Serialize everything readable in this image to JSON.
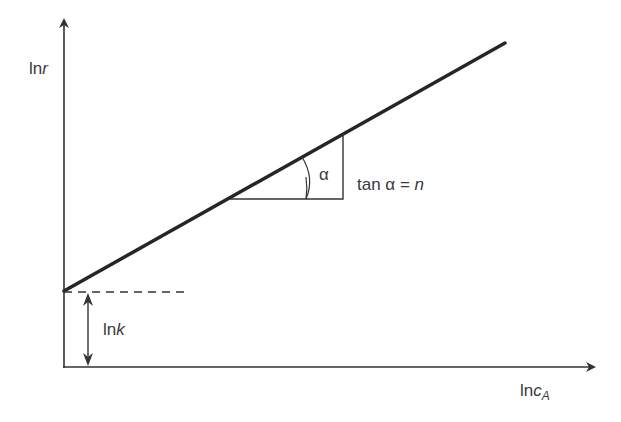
{
  "diagram": {
    "y_axis_label": {
      "prefix": "ln",
      "var": "r"
    },
    "x_axis_label": {
      "prefix": "ln",
      "var": "c",
      "subscript": "A"
    },
    "angle_symbol": "α",
    "slope_label": {
      "text": "tan α = ",
      "var": "n"
    },
    "intercept_label": {
      "prefix": "ln",
      "var": "k"
    },
    "colors": {
      "line": "#262626",
      "axes": "#333333",
      "text": "#3a3a3a"
    }
  }
}
